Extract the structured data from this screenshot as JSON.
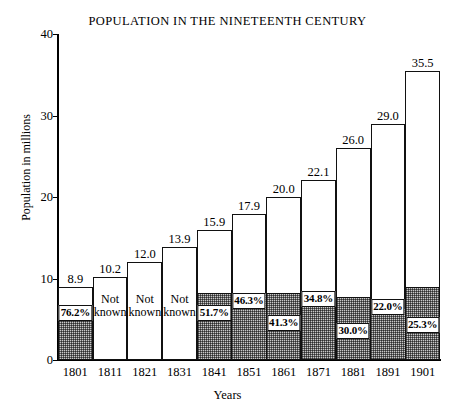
{
  "chart_data": {
    "type": "bar",
    "title": "POPULATION IN THE NINETEENTH CENTURY",
    "xlabel": "Years",
    "ylabel": "Population in millions",
    "categories": [
      "1801",
      "1811",
      "1821",
      "1831",
      "1841",
      "1851",
      "1861",
      "1871",
      "1881",
      "1891",
      "1901"
    ],
    "values": [
      8.9,
      10.2,
      12.0,
      13.9,
      15.9,
      17.9,
      20.0,
      22.1,
      26.0,
      29.0,
      35.5
    ],
    "value_labels": [
      "8.9",
      "10.2",
      "12.0",
      "13.9",
      "15.9",
      "17.9",
      "20.0",
      "22.1",
      "26.0",
      "29.0",
      "35.5"
    ],
    "segment_labels": [
      "76.2%",
      "Not known",
      "Not known",
      "Not known",
      "51.7%",
      "46.3%",
      "41.3%",
      "34.8%",
      "30.0%",
      "22.0%",
      "25.3%"
    ],
    "segment_percents": [
      76.2,
      null,
      null,
      null,
      51.7,
      46.3,
      41.3,
      34.8,
      30.0,
      22.0,
      25.3
    ],
    "segment_values": [
      6.78,
      null,
      null,
      null,
      8.22,
      8.29,
      8.26,
      7.69,
      7.8,
      6.38,
      8.98
    ],
    "ylim": [
      0,
      40
    ],
    "yticks": [
      0,
      10,
      20,
      30,
      40
    ],
    "ytick_labels": [
      "0",
      "10",
      "20",
      "30",
      "40"
    ],
    "grid": false,
    "legend": null
  }
}
